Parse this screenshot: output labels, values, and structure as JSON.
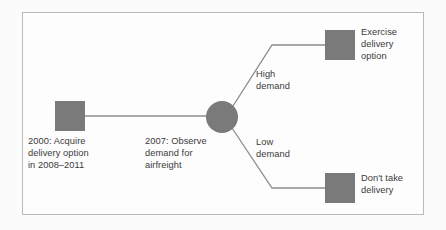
{
  "diagram": {
    "type": "decision-tree",
    "colors": {
      "node_fill": "#7a7a7a",
      "connector": "#8c8c8c",
      "frame_border": "#b9b9b9",
      "text": "#3b3b3b",
      "canvas": "#fdfdfd",
      "page_background": "#fbfbfb"
    },
    "nodes": [
      {
        "id": "decision-start",
        "shape": "square",
        "label": "2000: Acquire\ndelivery option\nin 2008–2011",
        "label_position": "below"
      },
      {
        "id": "chance-node",
        "shape": "circle",
        "label": "2007: Observe\ndemand for\nairfreight",
        "label_position": "below-left"
      },
      {
        "id": "outcome-exercise",
        "shape": "square",
        "label": "Exercise\ndelivery\noption",
        "label_position": "right"
      },
      {
        "id": "outcome-dont-take",
        "shape": "square",
        "label": "Don't take\ndelivery",
        "label_position": "right"
      }
    ],
    "branches": [
      {
        "id": "branch-high",
        "label": "High\ndemand",
        "from": "chance-node",
        "to": "outcome-exercise"
      },
      {
        "id": "branch-low",
        "label": "Low\ndemand",
        "from": "chance-node",
        "to": "outcome-dont-take"
      }
    ],
    "edges": [
      {
        "id": "edge-start-to-chance",
        "from": "decision-start",
        "to": "chance-node"
      }
    ]
  }
}
